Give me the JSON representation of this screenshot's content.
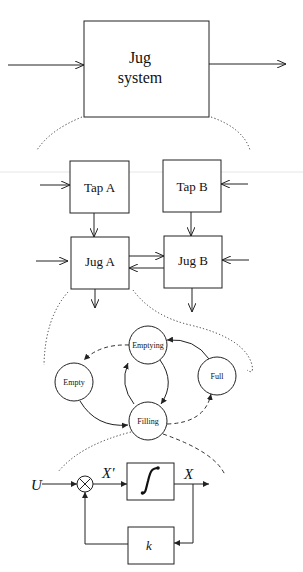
{
  "diagram": {
    "level1": {
      "block": {
        "line1": "Jug",
        "line2": "system"
      }
    },
    "level2": {
      "tap_a": "Tap A",
      "tap_b": "Tap B",
      "jug_a": "Jug A",
      "jug_b": "Jug B"
    },
    "level3": {
      "states": {
        "emptying": "Emptying",
        "empty": "Empty",
        "full": "Full",
        "filling": "Filling"
      }
    },
    "level4": {
      "input": "U",
      "derivative": "X'",
      "output": "X",
      "gain": "k",
      "integrator_symbol": "∫"
    }
  },
  "colors": {
    "stroke": "#222222",
    "background": "#ffffff",
    "separator": "#e4e4e4"
  }
}
